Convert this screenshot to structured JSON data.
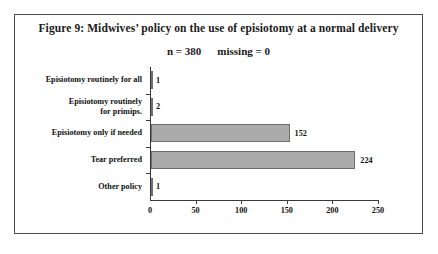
{
  "figure": {
    "title": "Figure 9: Midwives’ policy on the use of episiotomy at a normal delivery",
    "subtitle_n": "n = 380",
    "subtitle_missing": "missing = 0"
  },
  "chart_data": {
    "type": "bar",
    "orientation": "horizontal",
    "title": "Figure 9: Midwives’ policy on the use of episiotomy at a normal delivery",
    "subtitle": "n = 380    missing = 0",
    "categories": [
      "Episiotomy routinely for all",
      "Episiotomy routinely for primips.",
      "Episiotomy only if needed",
      "Tear preferred",
      "Other policy"
    ],
    "category_lines": [
      [
        "Episiotomy routinely for all"
      ],
      [
        "Episiotomy routinely",
        "for primips."
      ],
      [
        "Episiotomy only if needed"
      ],
      [
        "Tear preferred"
      ],
      [
        "Other policy"
      ]
    ],
    "values": [
      1,
      2,
      152,
      224,
      1
    ],
    "value_labels": [
      "1",
      "2",
      "152",
      "224",
      "1"
    ],
    "xlabel": "",
    "ylabel": "",
    "xlim": [
      0,
      250
    ],
    "xticks": [
      0,
      50,
      100,
      150,
      200,
      250
    ],
    "xtick_labels": [
      "0",
      "50",
      "100",
      "150",
      "200",
      "250"
    ],
    "grid": false,
    "legend": false,
    "n": 380,
    "missing": 0,
    "bar_color": "#ababab",
    "bar_border_color": "#6e6e6e",
    "axis_color": "#3a3a3a",
    "frame_color": "#4a4a4a"
  }
}
